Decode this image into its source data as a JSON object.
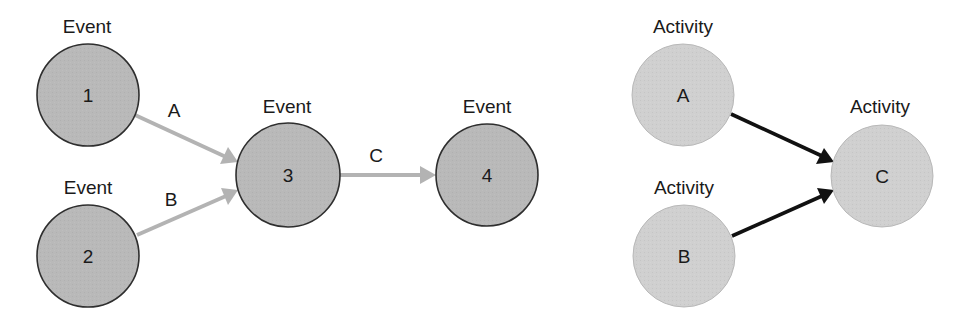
{
  "colors": {
    "event_fill": "#b9b9b9",
    "event_stroke": "#2e2e2e",
    "activity_fill": "#d0d0d0",
    "activity_stroke": "#b0b0b0",
    "aoa_arrow": "#b3b3b3",
    "aon_arrow": "#111111"
  },
  "left_diagram": {
    "nodes": [
      {
        "id": "1",
        "caption": "Event",
        "label": "1"
      },
      {
        "id": "2",
        "caption": "Event",
        "label": "2"
      },
      {
        "id": "3",
        "caption": "Event",
        "label": "3"
      },
      {
        "id": "4",
        "caption": "Event",
        "label": "4"
      }
    ],
    "edges": [
      {
        "from": "1",
        "to": "3",
        "label": "A"
      },
      {
        "from": "2",
        "to": "3",
        "label": "B"
      },
      {
        "from": "3",
        "to": "4",
        "label": "C"
      }
    ]
  },
  "right_diagram": {
    "nodes": [
      {
        "id": "A",
        "caption": "Activity",
        "label": "A"
      },
      {
        "id": "B",
        "caption": "Activity",
        "label": "B"
      },
      {
        "id": "C",
        "caption": "Activity",
        "label": "C"
      }
    ],
    "edges": [
      {
        "from": "A",
        "to": "C"
      },
      {
        "from": "B",
        "to": "C"
      }
    ]
  }
}
